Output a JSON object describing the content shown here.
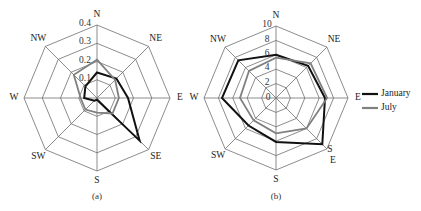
{
  "chart_data": [
    {
      "type": "radar",
      "subtitle": "(a)",
      "directions": [
        "N",
        "NE",
        "E",
        "SE",
        "S",
        "SW",
        "W",
        "NW"
      ],
      "rlim": [
        0,
        0.4
      ],
      "rticks": [
        "0.1",
        "0.2",
        "0.3",
        "0.4"
      ],
      "rtick_values": [
        0.1,
        0.2,
        0.3,
        0.4
      ],
      "series": [
        {
          "name": "January",
          "color": "#111111",
          "values": [
            0.14,
            0.15,
            0.17,
            0.33,
            0.01,
            0.02,
            0.07,
            0.09
          ]
        },
        {
          "name": "July",
          "color": "#808080",
          "values": [
            0.21,
            0.14,
            0.12,
            0.12,
            0.08,
            0.09,
            0.09,
            0.18
          ]
        }
      ]
    },
    {
      "type": "radar",
      "subtitle": "(b)",
      "directions": [
        "N",
        "NE",
        "E",
        "SE",
        "S",
        "SW",
        "W",
        "NW"
      ],
      "direction_labels": [
        "N",
        "NE",
        "E",
        "S\nE",
        "S",
        "SW",
        "W",
        "NW"
      ],
      "rlim": [
        0,
        10
      ],
      "rticks": [
        "0",
        "2",
        "4",
        "6",
        "8",
        "10"
      ],
      "rtick_values": [
        0,
        2,
        4,
        6,
        8,
        10
      ],
      "series": [
        {
          "name": "January",
          "color": "#111111",
          "values": [
            6.0,
            6.3,
            6.8,
            9.1,
            6.1,
            5.4,
            7.5,
            7.4
          ]
        },
        {
          "name": "July",
          "color": "#808080",
          "values": [
            5.6,
            6.8,
            7.1,
            6.0,
            4.9,
            4.4,
            5.0,
            5.3
          ]
        }
      ],
      "legend": {
        "placement": "right",
        "entries": [
          {
            "label": "January",
            "color": "#111111"
          },
          {
            "label": "July",
            "color": "#808080"
          }
        ]
      }
    }
  ]
}
